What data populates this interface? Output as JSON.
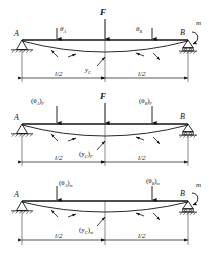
{
  "figure": {
    "type": "beam-deflection-superposition",
    "background_color": "#ffffff",
    "line_color": "#111111",
    "panel_count": 3
  },
  "panels": [
    {
      "id": "panel-combined",
      "index": 1,
      "description": "Simply supported beam AB with central force F and end moment m; deflection curve shown",
      "supports": {
        "left": "pin",
        "right": "roller"
      },
      "node_left_label": "A",
      "node_right_label": "B",
      "loads": [
        {
          "name": "force",
          "label": "F",
          "position": "midspan",
          "direction": "down"
        },
        {
          "name": "moment",
          "label": "m",
          "position": "right-end",
          "direction": "counterclockwise"
        }
      ],
      "slope_left_label": "θ",
      "slope_left_sub": "A",
      "slope_right_label": "θ",
      "slope_right_sub": "B",
      "deflection_label": "y",
      "deflection_sub": "C",
      "dim_left": "l/2",
      "dim_right": "l/2"
    },
    {
      "id": "panel-force-only",
      "index": 2,
      "description": "Simply supported beam AB with central force F only; deflection curve shown",
      "supports": {
        "left": "pin",
        "right": "roller"
      },
      "node_left_label": "A",
      "node_right_label": "B",
      "loads": [
        {
          "name": "force",
          "label": "F",
          "position": "midspan",
          "direction": "down"
        }
      ],
      "slope_left_label": "(θ",
      "slope_left_sub": "A",
      "slope_left_tail": ")",
      "slope_left_outer_sub": "F",
      "slope_right_label": "(θ",
      "slope_right_sub": "B",
      "slope_right_tail": ")",
      "slope_right_outer_sub": "F",
      "deflection_label": "(y",
      "deflection_sub": "C",
      "deflection_tail": ")",
      "deflection_outer_sub": "F",
      "dim_left": "l/2",
      "dim_right": "l/2"
    },
    {
      "id": "panel-moment-only",
      "index": 3,
      "description": "Simply supported beam AB with end moment m only; deflection curve shown",
      "supports": {
        "left": "pin",
        "right": "roller"
      },
      "node_left_label": "A",
      "node_right_label": "B",
      "loads": [
        {
          "name": "moment",
          "label": "m",
          "position": "right-end",
          "direction": "counterclockwise"
        }
      ],
      "slope_left_label": "(θ",
      "slope_left_sub": "A",
      "slope_left_tail": ")",
      "slope_left_outer_sub": "m",
      "slope_right_label": "(θ",
      "slope_right_sub": "B",
      "slope_right_tail": ")",
      "slope_right_outer_sub": "m",
      "deflection_label": "(y",
      "deflection_sub": "C",
      "deflection_tail": ")",
      "deflection_outer_sub": "m",
      "dim_left": "l/2",
      "dim_right": "l/2"
    }
  ]
}
